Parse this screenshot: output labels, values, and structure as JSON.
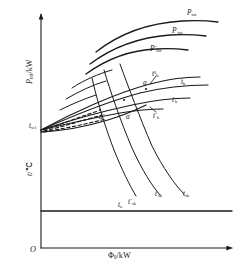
{
  "figure": {
    "type": "technical-diagram"
  },
  "axes": {
    "origin_label": "O",
    "x_axis": {
      "name": "Phi_0",
      "unit": "kW",
      "label_plain": "Φ0/kW"
    },
    "y_axis_upper": {
      "name": "P_tot",
      "unit": "kW",
      "label_plain": "Ptot/kW"
    },
    "y_axis_lower": {
      "name": "t",
      "unit": "°C",
      "label_plain": "t/°C"
    }
  },
  "curves": {
    "power": [
      {
        "id": "p-tot",
        "label_base": "P",
        "label_sub": "tot",
        "label_sup": ""
      },
      {
        "id": "p-tot-1",
        "label_base": "P",
        "label_sub": "tot",
        "label_sup": "′"
      },
      {
        "id": "p-tot-2",
        "label_base": "P",
        "label_sub": "tot",
        "label_sup": "″"
      }
    ],
    "tk_family": [
      {
        "id": "tk-0",
        "label_base": "t",
        "label_sub": "k",
        "label_sup": "0"
      },
      {
        "id": "tk",
        "label_base": "t",
        "label_sub": "k",
        "label_sup": ""
      },
      {
        "id": "tk-1",
        "label_base": "t",
        "label_sub": "k",
        "label_sup": "′"
      },
      {
        "id": "tk-2",
        "label_base": "t",
        "label_sub": "k",
        "label_sup": "″"
      }
    ],
    "tsk_family": [
      {
        "id": "tsk-2",
        "label_base": "t",
        "label_sub": "sk",
        "label_sup": "″"
      },
      {
        "id": "tsk-1",
        "label_base": "t",
        "label_sub": "sk",
        "label_sup": "′"
      },
      {
        "id": "tsk",
        "label_base": "t",
        "label_sub": "sk",
        "label_sup": ""
      }
    ],
    "ambient": {
      "id": "t-a",
      "label_base": "t",
      "label_sub": "a",
      "label_sup": ""
    },
    "inlet": {
      "id": "t-w1",
      "label_base": "t",
      "label_sub": "w1",
      "label_sup": ""
    }
  },
  "points": [
    {
      "id": "a",
      "label_base": "a",
      "label_sup": ""
    },
    {
      "id": "a1",
      "label_base": "a",
      "label_sup": "′"
    },
    {
      "id": "a2",
      "label_base": "a",
      "label_sup": "″"
    }
  ],
  "colors": {
    "ink": "#1a1a1a",
    "background": "#ffffff"
  }
}
